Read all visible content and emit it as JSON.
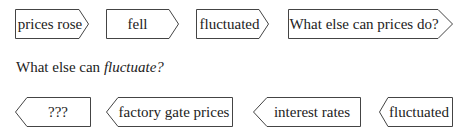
{
  "row1": {
    "items": [
      {
        "label": "prices rose",
        "direction": "right"
      },
      {
        "label": "fell",
        "direction": "right"
      },
      {
        "label": "fluctuated",
        "direction": "right"
      },
      {
        "label": "What else can prices do?",
        "direction": "right"
      }
    ]
  },
  "prompt": {
    "prefix": "What else can ",
    "emphasis": "fluctuate?"
  },
  "row2": {
    "items": [
      {
        "label": "???",
        "direction": "left"
      },
      {
        "label": "factory gate prices",
        "direction": "left"
      },
      {
        "label": "interest rates",
        "direction": "left"
      },
      {
        "label": "fluctuated",
        "direction": "left"
      }
    ]
  },
  "colors": {
    "stroke": "#444444",
    "text": "#222222",
    "background": "#ffffff"
  }
}
